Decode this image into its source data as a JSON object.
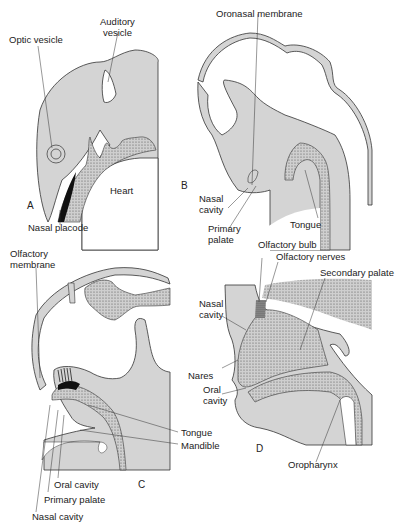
{
  "figure": {
    "panels": [
      {
        "id": "A",
        "letter": "A",
        "labels": {
          "optic_vesicle": "Optic vesicle",
          "auditory_vesicle": "Auditory\nvesicle",
          "heart": "Heart",
          "nasal_placode": "Nasal placode"
        }
      },
      {
        "id": "B",
        "letter": "B",
        "labels": {
          "oronasal_membrane": "Oronasal membrane",
          "nasal_cavity": "Nasal\ncavity",
          "primary_palate": "Primary\npalate",
          "tongue": "Tongue"
        }
      },
      {
        "id": "C",
        "letter": "C",
        "labels": {
          "olfactory_membrane": "Olfactory\nmembrane",
          "tongue": "Tongue",
          "mandible": "Mandible",
          "oral_cavity": "Oral cavity",
          "primary_palate": "Primary palate",
          "nasal_cavity": "Nasal cavity"
        }
      },
      {
        "id": "D",
        "letter": "D",
        "labels": {
          "olfactory_bulb": "Olfactory bulb",
          "olfactory_nerves": "Olfactory nerves",
          "secondary_palate": "Secondary palate",
          "nasal_cavity": "Nasal\ncavity",
          "nares": "Nares",
          "oral_cavity": "Oral\ncavity",
          "oropharynx": "Oropharynx"
        }
      }
    ],
    "colors": {
      "tissue_fill": "#d4d4d4",
      "outline": "#333333",
      "background": "#ffffff",
      "dark_epithelium": "#111111"
    }
  }
}
